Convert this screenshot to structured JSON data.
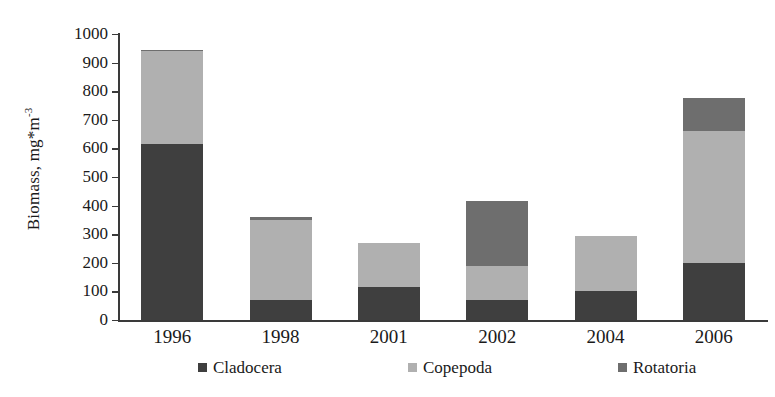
{
  "chart_data": {
    "type": "bar",
    "stacked": true,
    "title": "",
    "xlabel": "",
    "ylabel": "Biomass, mg*m-3",
    "ylabel_main": "Biomass, mg*m",
    "ylabel_exponent": "-3",
    "categories": [
      "1996",
      "1998",
      "2001",
      "2002",
      "2004",
      "2006"
    ],
    "series": [
      {
        "name": "Cladocera",
        "color": "#3f3f3f",
        "values": [
          615,
          70,
          115,
          70,
          100,
          200
        ]
      },
      {
        "name": "Copepoda",
        "color": "#b0b0b0",
        "values": [
          325,
          280,
          155,
          120,
          195,
          460
        ]
      },
      {
        "name": "Rotatoria",
        "color": "#6e6e6e",
        "values": [
          5,
          10,
          0,
          225,
          0,
          115
        ]
      }
    ],
    "totals": [
      945,
      360,
      270,
      415,
      295,
      775
    ],
    "ylim": [
      0,
      1000
    ],
    "yticks": [
      "1000",
      "900",
      "800",
      "700",
      "600",
      "500",
      "400",
      "300",
      "200",
      "100",
      "0"
    ],
    "ytick_values": [
      1000,
      900,
      800,
      700,
      600,
      500,
      400,
      300,
      200,
      100,
      0
    ],
    "grid": false,
    "legend_position": "bottom"
  },
  "legend": {
    "items": [
      {
        "label": "Cladocera",
        "color": "#3f3f3f"
      },
      {
        "label": "Copepoda",
        "color": "#b0b0b0"
      },
      {
        "label": "Rotatoria",
        "color": "#6e6e6e"
      }
    ]
  },
  "axis": {
    "y_title_main": "Biomass, mg*m",
    "y_title_sup": "-3"
  }
}
